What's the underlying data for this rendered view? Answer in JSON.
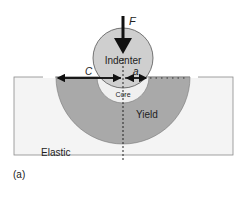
{
  "figure": {
    "panel_label": "(a)",
    "labels": {
      "force": "F",
      "indenter": "Indenter",
      "core": "Core",
      "yield": "Yield",
      "elastic": "Elastic",
      "c_dim": "C",
      "a_dim": "a"
    },
    "colors": {
      "background": "#ffffff",
      "elastic_region": "#f4f4f4",
      "yield_region": "#a9a9a9",
      "indenter": "#cfcfcf",
      "core": "#f0f0f0",
      "stroke": "#555555",
      "arrow": "#111111"
    }
  }
}
